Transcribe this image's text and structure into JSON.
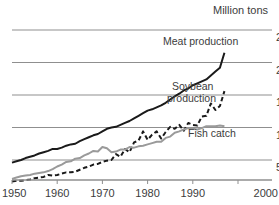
{
  "chart_data": {
    "type": "line",
    "title": "",
    "unit_label": "Million tons",
    "xlabel": "",
    "ylabel": "Million tons",
    "xlim": [
      1950,
      2000
    ],
    "ylim": [
      0,
      262
    ],
    "grid": true,
    "gridlines_y": [
      50,
      100,
      150,
      200,
      250
    ],
    "legend_position": "inline-annotations",
    "xticks": [
      "1950",
      "1960",
      "1970",
      "1980",
      "1990",
      "2000"
    ],
    "xtick_values": [
      1950,
      1960,
      1970,
      1980,
      1990,
      2000
    ],
    "yticks": [
      "50",
      "100",
      "150",
      "200",
      "250"
    ],
    "ytick_values": [
      50,
      100,
      150,
      200,
      250
    ],
    "ytick_side": "right",
    "series": [
      {
        "name": "Meat production",
        "style": "solid",
        "color": "#1a1a1a",
        "width": 2.0,
        "x": [
          1950,
          1951,
          1952,
          1953,
          1954,
          1955,
          1956,
          1957,
          1958,
          1959,
          1960,
          1961,
          1962,
          1963,
          1964,
          1965,
          1966,
          1967,
          1968,
          1969,
          1970,
          1971,
          1972,
          1973,
          1974,
          1975,
          1976,
          1977,
          1978,
          1979,
          1980,
          1981,
          1982,
          1983,
          1984,
          1985,
          1986,
          1987,
          1988,
          1989,
          1990,
          1991,
          1992,
          1993,
          1994,
          1995,
          1996,
          1997
        ],
        "values": [
          46,
          48,
          50,
          53,
          55,
          57,
          60,
          62,
          64,
          67,
          67,
          69,
          72,
          74,
          75,
          79,
          82,
          85,
          88,
          90,
          94,
          98,
          100,
          101,
          104,
          107,
          110,
          114,
          118,
          122,
          126,
          128,
          131,
          134,
          138,
          143,
          148,
          152,
          157,
          160,
          165,
          168,
          171,
          174,
          180,
          186,
          192,
          215
        ]
      },
      {
        "name": "Soybean production",
        "style": "dashed",
        "color": "#1a1a1a",
        "width": 2.0,
        "x": [
          1950,
          1951,
          1952,
          1953,
          1954,
          1955,
          1956,
          1957,
          1958,
          1959,
          1960,
          1961,
          1962,
          1963,
          1964,
          1965,
          1966,
          1967,
          1968,
          1969,
          1970,
          1971,
          1972,
          1973,
          1974,
          1975,
          1976,
          1977,
          1978,
          1979,
          1980,
          1981,
          1982,
          1983,
          1984,
          1985,
          1986,
          1987,
          1988,
          1989,
          1990,
          1991,
          1992,
          1993,
          1994,
          1995,
          1996,
          1997
        ],
        "values": [
          17,
          18,
          18,
          19,
          20,
          22,
          23,
          24,
          27,
          26,
          27,
          29,
          31,
          31,
          32,
          35,
          38,
          40,
          43,
          44,
          47,
          49,
          50,
          59,
          55,
          67,
          62,
          77,
          80,
          94,
          81,
          89,
          94,
          83,
          93,
          101,
          98,
          104,
          95,
          107,
          104,
          103,
          117,
          118,
          137,
          127,
          133,
          156
        ]
      },
      {
        "name": "Fish catch",
        "style": "solid",
        "color": "#9a9a9a",
        "width": 2.0,
        "x": [
          1950,
          1951,
          1952,
          1953,
          1954,
          1955,
          1956,
          1957,
          1958,
          1959,
          1960,
          1961,
          1962,
          1963,
          1964,
          1965,
          1966,
          1967,
          1968,
          1969,
          1970,
          1971,
          1972,
          1973,
          1974,
          1975,
          1976,
          1977,
          1978,
          1979,
          1980,
          1981,
          1982,
          1983,
          1984,
          1985,
          1986,
          1987,
          1988,
          1989,
          1990,
          1991,
          1992,
          1993,
          1994,
          1995,
          1996,
          1997
        ],
        "values": [
          21,
          23,
          25,
          26,
          27,
          29,
          30,
          31,
          33,
          36,
          40,
          43,
          47,
          48,
          52,
          53,
          57,
          60,
          64,
          63,
          70,
          68,
          62,
          63,
          66,
          66,
          70,
          69,
          71,
          72,
          74,
          76,
          78,
          78,
          84,
          86,
          92,
          94,
          97,
          99,
          98,
          97,
          99,
          102,
          102,
          102,
          103,
          102
        ]
      }
    ],
    "annotations": [
      {
        "text": "Meat production",
        "target_series": "Meat production",
        "x_px": 163,
        "y_px": 45
      },
      {
        "text": "Soybean",
        "target_series": "Soybean production",
        "x_px": 172,
        "y_px": 90
      },
      {
        "text": "production",
        "target_series": "Soybean production",
        "x_px": 167,
        "y_px": 102
      },
      {
        "text": "Fish catch",
        "target_series": "Fish catch",
        "x_px": 188,
        "y_px": 137
      },
      {
        "text": "Million tons",
        "target_series": "",
        "x_px": 213,
        "y_px": 14
      }
    ]
  },
  "colors": {
    "background": "#ffffff",
    "gridline": "#8f8f8f",
    "axis": "#8f8f8f",
    "meat": "#1a1a1a",
    "soybean": "#1a1a1a",
    "fish": "#9a9a9a",
    "text": "#3c3c3c"
  }
}
